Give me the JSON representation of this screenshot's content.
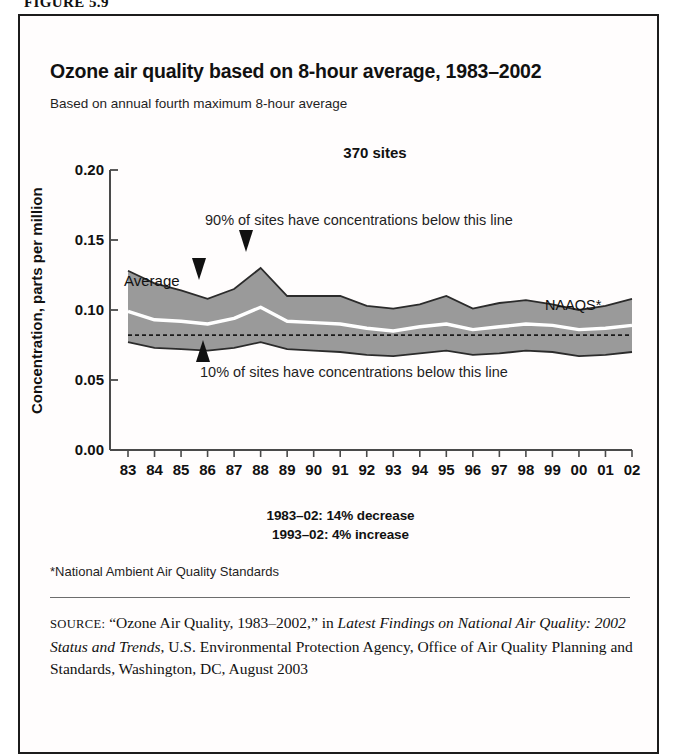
{
  "figure": {
    "label": "FIGURE 5.9"
  },
  "chart": {
    "title": "Ozone air quality based on 8-hour average, 1983–2002",
    "subtitle": "Based on annual fourth maximum 8-hour average",
    "sites_label": "370 sites",
    "upper_annotation": "90% of sites have concentrations below this line",
    "lower_annotation": "10% of sites have concentrations below this line",
    "average_label": "Average",
    "naaqs_label": "NAAQS*"
  },
  "trend_notes": [
    "1983–02: 14% decrease",
    "1993–02: 4% increase"
  ],
  "footnote": "*National Ambient Air Quality Standards",
  "source": {
    "prefix": "SOURCE:",
    "part1": " “Ozone Air Quality, 1983–2002,” in ",
    "italic1": "Latest Findings on National Air Quality: 2002 Status and Trends",
    "part2": ", U.S. Environmental Protection Agency, Office of Air Quality Planning and Standards, Washington, DC, August 2003"
  },
  "colors": {
    "band_fill": "#9a9a9a",
    "band_edge": "#2b2b2b",
    "average_line": "#ffffff",
    "naaqs_line": "#1a1a1a",
    "axis": "#4a4a4a",
    "text": "#111111"
  },
  "chart_data": {
    "type": "area",
    "title": "Ozone air quality based on 8-hour average, 1983–2002",
    "subtitle": "Based on annual fourth maximum 8-hour average",
    "xlabel": "",
    "ylabel": "Concentration, parts per million",
    "ylim": [
      0.0,
      0.2
    ],
    "yticks": [
      0.0,
      0.05,
      0.1,
      0.15,
      0.2
    ],
    "ytick_labels": [
      "0.00",
      "0.05",
      "0.10",
      "0.15",
      "0.20"
    ],
    "grid": false,
    "legend": "annotations-inline",
    "x": [
      "83",
      "84",
      "85",
      "86",
      "87",
      "88",
      "89",
      "90",
      "91",
      "92",
      "93",
      "94",
      "95",
      "96",
      "97",
      "98",
      "99",
      "00",
      "01",
      "02"
    ],
    "series": [
      {
        "name": "90th percentile",
        "role": "band-upper",
        "values": [
          0.128,
          0.119,
          0.114,
          0.108,
          0.115,
          0.13,
          0.11,
          0.11,
          0.11,
          0.103,
          0.101,
          0.104,
          0.11,
          0.101,
          0.105,
          0.107,
          0.104,
          0.1,
          0.103,
          0.108
        ]
      },
      {
        "name": "Average",
        "role": "line",
        "values": [
          0.099,
          0.093,
          0.092,
          0.09,
          0.094,
          0.102,
          0.092,
          0.091,
          0.09,
          0.087,
          0.085,
          0.088,
          0.09,
          0.086,
          0.088,
          0.09,
          0.089,
          0.086,
          0.087,
          0.089
        ]
      },
      {
        "name": "10th percentile",
        "role": "band-lower",
        "values": [
          0.077,
          0.073,
          0.072,
          0.071,
          0.073,
          0.077,
          0.072,
          0.071,
          0.07,
          0.068,
          0.067,
          0.069,
          0.071,
          0.068,
          0.069,
          0.071,
          0.07,
          0.067,
          0.068,
          0.07
        ]
      }
    ],
    "reference_lines": [
      {
        "name": "NAAQS*",
        "value": 0.082,
        "style": "dashed"
      }
    ],
    "annotations": [
      {
        "text": "370 sites",
        "x": "88",
        "y": 0.185
      },
      {
        "text": "90% of sites have concentrations below this line",
        "points_to": "band-upper"
      },
      {
        "text": "10% of sites have concentrations below this line",
        "points_to": "band-lower"
      },
      {
        "text": "Average",
        "points_to": "line"
      },
      {
        "text": "1983–02: 14% decrease"
      },
      {
        "text": "1993–02: 4% increase"
      }
    ]
  }
}
